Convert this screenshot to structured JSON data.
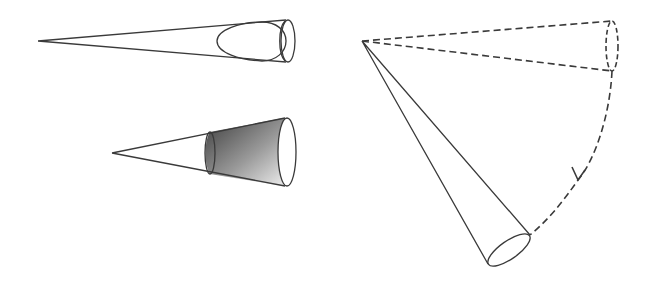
{
  "diagram": {
    "description": "Three cone illustrations: a long narrow cone with an inner egg-shaped cross section, a shaded truncated cone section, and a cone rotating along a dashed circular path with an arrow",
    "colors": {
      "line": "#3a3a3a",
      "background": "#ffffff",
      "shade_dark": "#4a4a4a",
      "shade_light": "#f0f0f0"
    },
    "figures": [
      {
        "id": "cone-with-egg",
        "apex": [
          38,
          41
        ],
        "rim": {
          "cx": 288,
          "cy": 41,
          "rx": 7,
          "ry": 21
        },
        "inner_shape": "egg",
        "label": ""
      },
      {
        "id": "shaded-cone",
        "apex": [
          112,
          153
        ],
        "rim": {
          "cx": 287,
          "cy": 152,
          "rx": 9,
          "ry": 34
        },
        "inner_rim": {
          "cx": 210,
          "cy": 153,
          "rx": 5,
          "ry": 21
        },
        "shading": "gradient dark-to-light",
        "label": ""
      },
      {
        "id": "rotating-cone",
        "apex": [
          362,
          41
        ],
        "dashed_rim": {
          "cx": 612,
          "cy": 46,
          "rx": 6,
          "ry": 25
        },
        "solid_rim": {
          "cx": 509,
          "cy": 250,
          "rx": 23,
          "ry": 9,
          "rotate": -35
        },
        "path": "dashed arc with arrow",
        "label": ""
      }
    ]
  }
}
